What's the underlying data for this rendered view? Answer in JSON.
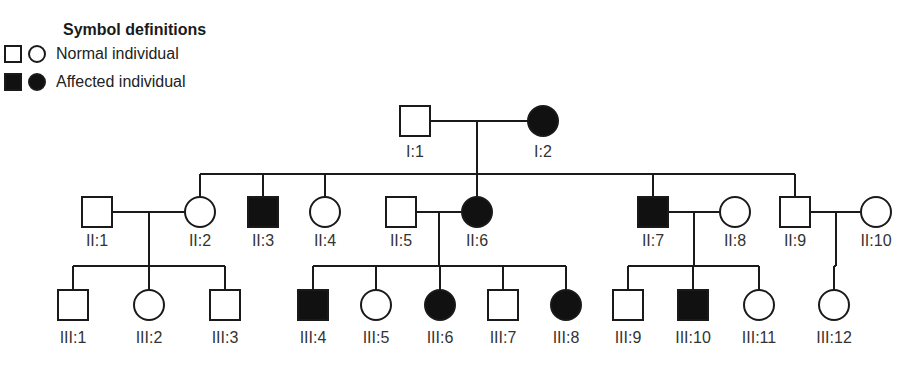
{
  "legend": {
    "title": "Symbol definitions",
    "items": [
      {
        "label": "Normal individual",
        "status": "normal",
        "symbols": [
          "male-square",
          "female-circle"
        ]
      },
      {
        "label": "Affected individual",
        "status": "affected",
        "symbols": [
          "male-square",
          "female-circle"
        ]
      }
    ]
  },
  "colors": {
    "affected": "#111111",
    "normal": "#ffffff",
    "line": "#1a1a1a"
  },
  "individuals": [
    {
      "id": "I:1",
      "sex": "male",
      "affected": false,
      "generation": 1
    },
    {
      "id": "I:2",
      "sex": "female",
      "affected": true,
      "generation": 1
    },
    {
      "id": "II:1",
      "sex": "male",
      "affected": false,
      "generation": 2
    },
    {
      "id": "II:2",
      "sex": "female",
      "affected": false,
      "generation": 2
    },
    {
      "id": "II:3",
      "sex": "male",
      "affected": true,
      "generation": 2
    },
    {
      "id": "II:4",
      "sex": "female",
      "affected": false,
      "generation": 2
    },
    {
      "id": "II:5",
      "sex": "male",
      "affected": false,
      "generation": 2
    },
    {
      "id": "II:6",
      "sex": "female",
      "affected": true,
      "generation": 2
    },
    {
      "id": "II:7",
      "sex": "male",
      "affected": true,
      "generation": 2
    },
    {
      "id": "II:8",
      "sex": "female",
      "affected": false,
      "generation": 2
    },
    {
      "id": "II:9",
      "sex": "male",
      "affected": false,
      "generation": 2
    },
    {
      "id": "II:10",
      "sex": "female",
      "affected": false,
      "generation": 2
    },
    {
      "id": "III:1",
      "sex": "male",
      "affected": false,
      "generation": 3
    },
    {
      "id": "III:2",
      "sex": "female",
      "affected": false,
      "generation": 3
    },
    {
      "id": "III:3",
      "sex": "male",
      "affected": false,
      "generation": 3
    },
    {
      "id": "III:4",
      "sex": "male",
      "affected": true,
      "generation": 3
    },
    {
      "id": "III:5",
      "sex": "female",
      "affected": false,
      "generation": 3
    },
    {
      "id": "III:6",
      "sex": "female",
      "affected": true,
      "generation": 3
    },
    {
      "id": "III:7",
      "sex": "male",
      "affected": false,
      "generation": 3
    },
    {
      "id": "III:8",
      "sex": "female",
      "affected": true,
      "generation": 3
    },
    {
      "id": "III:9",
      "sex": "male",
      "affected": false,
      "generation": 3
    },
    {
      "id": "III:10",
      "sex": "male",
      "affected": true,
      "generation": 3
    },
    {
      "id": "III:11",
      "sex": "female",
      "affected": false,
      "generation": 3
    },
    {
      "id": "III:12",
      "sex": "female",
      "affected": false,
      "generation": 3
    }
  ],
  "matings": [
    {
      "partners": [
        "I:1",
        "I:2"
      ],
      "children": [
        "II:2",
        "II:3",
        "II:4",
        "II:6",
        "II:7",
        "II:9"
      ]
    },
    {
      "partners": [
        "II:1",
        "II:2"
      ],
      "children": [
        "III:1",
        "III:2",
        "III:3"
      ]
    },
    {
      "partners": [
        "II:5",
        "II:6"
      ],
      "children": [
        "III:4",
        "III:5",
        "III:6",
        "III:7",
        "III:8"
      ]
    },
    {
      "partners": [
        "II:7",
        "II:8"
      ],
      "children": [
        "III:9",
        "III:10",
        "III:11"
      ]
    },
    {
      "partners": [
        "II:9",
        "II:10"
      ],
      "children": [
        "III:12"
      ]
    }
  ]
}
